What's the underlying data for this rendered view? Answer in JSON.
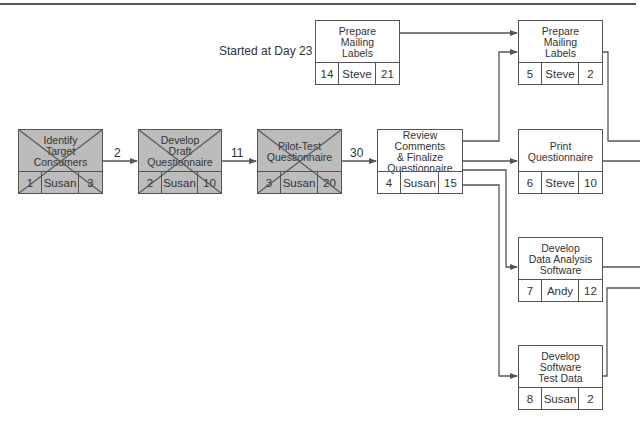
{
  "annotation": "Started at Day 23",
  "colors": {
    "line": "#555555",
    "completed_fill": "#bcbcbc",
    "pending_fill": "#ffffff"
  },
  "nodes": [
    {
      "id": "1",
      "title": "Identify\nTarget\nConsumers",
      "owner": "Susan",
      "duration": "3",
      "status": "completed"
    },
    {
      "id": "2",
      "title": "Develop\nDraft\nQuestionnaire",
      "owner": "Susan",
      "duration": "10",
      "status": "completed"
    },
    {
      "id": "3",
      "title": "Pilot-Test\nQuestionnaire",
      "owner": "Susan",
      "duration": "20",
      "status": "completed"
    },
    {
      "id": "4",
      "title": "Review Comments\n& Finalize\nQuestionnaire",
      "owner": "Susan",
      "duration": "15",
      "status": "pending"
    },
    {
      "id": "14",
      "title": "Prepare\nMailing\nLabels",
      "owner": "Steve",
      "duration": "21",
      "status": "pending"
    },
    {
      "id": "5",
      "title": "Prepare\nMailing\nLabels",
      "owner": "Steve",
      "duration": "2",
      "status": "pending"
    },
    {
      "id": "6",
      "title": "Print\nQuestionnaire",
      "owner": "Steve",
      "duration": "10",
      "status": "pending"
    },
    {
      "id": "7",
      "title": "Develop\nData Analysis\nSoftware",
      "owner": "Andy",
      "duration": "12",
      "status": "pending"
    },
    {
      "id": "8",
      "title": "Develop\nSoftware\nTest Data",
      "owner": "Susan",
      "duration": "2",
      "status": "pending"
    }
  ],
  "edge_labels": [
    {
      "from": "1",
      "to": "2",
      "label": "2"
    },
    {
      "from": "2",
      "to": "3",
      "label": "11"
    },
    {
      "from": "3",
      "to": "4",
      "label": "30"
    }
  ],
  "edges": [
    {
      "from": "1",
      "to": "2"
    },
    {
      "from": "2",
      "to": "3"
    },
    {
      "from": "3",
      "to": "4"
    },
    {
      "from": "14",
      "to": "5"
    },
    {
      "from": "4",
      "to": "5"
    },
    {
      "from": "4",
      "to": "6"
    },
    {
      "from": "4",
      "to": "7"
    },
    {
      "from": "4",
      "to": "8"
    }
  ]
}
